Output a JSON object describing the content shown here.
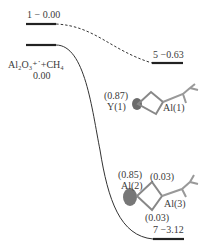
{
  "diagram": {
    "type": "energy_profile",
    "levels": [
      {
        "id": "level-1",
        "label": "1 − 0.00"
      },
      {
        "id": "level-reactant",
        "label_line1": "Al₂O₃⁺˙+CH₄",
        "label_line2": "0.00"
      },
      {
        "id": "level-5",
        "label": "5 −0.63"
      },
      {
        "id": "level-7",
        "label": "7 −3.12"
      }
    ],
    "structure_5": {
      "charge_y1": "(0.87)",
      "atom_y1": "Y(1)",
      "atom_al1": "Al(1)"
    },
    "structure_7": {
      "charge_al2": "(0.85)",
      "atom_al2": "Al(2)",
      "charge_top": "(0.03)",
      "atom_al3": "Al(3)",
      "charge_bottom": "(0.03)"
    },
    "colors": {
      "line": "#2a2a2a",
      "spin_density": "#707070"
    }
  }
}
